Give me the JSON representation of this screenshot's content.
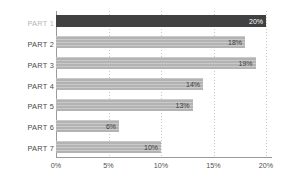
{
  "chart_data": {
    "type": "bar",
    "orientation": "horizontal",
    "title": "",
    "subtitle": "",
    "xlabel": "",
    "ylabel": "",
    "categories": [
      "PART 1",
      "PART 2",
      "PART 3",
      "PART 4",
      "PART 5",
      "PART 6",
      "PART 7"
    ],
    "values": [
      20,
      18,
      19,
      14,
      13,
      6,
      10
    ],
    "value_labels": [
      "20%",
      "18%",
      "19%",
      "14%",
      "13%",
      "6%",
      "10%"
    ],
    "xlim": [
      0,
      20
    ],
    "x_ticks": [
      0,
      5,
      10,
      15,
      20
    ],
    "x_tick_labels": [
      "0%",
      "5%",
      "10%",
      "15%",
      "20%"
    ],
    "grid": true,
    "grid_axis": "x",
    "legend": null,
    "highlight_index": 0,
    "colors": {
      "bar": "#b3b3b3",
      "bar_highlight": "#414141",
      "label": "#4a4a4a",
      "label_muted": "#b6b6b6",
      "value_label": "#3d3d3d",
      "value_label_on_highlight": "#ffffff",
      "gridline": "#c9c9c9",
      "axis": "#9a9a9a",
      "background": "#ffffff"
    }
  }
}
